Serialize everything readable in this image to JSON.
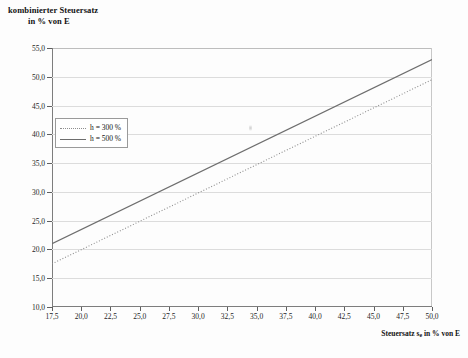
{
  "chart_data": {
    "type": "line",
    "title": "kombinierter Steuersatz in % von E",
    "title_line1": "kombinierter Steuersatz",
    "title_line2": "in % von E",
    "xlabel": "Steuersatz se in % von E",
    "xlabel_main": "Steuersatz s",
    "xlabel_sub": "e",
    "xlabel_tail": " in % von E",
    "ylabel": "kombinierter Steuersatz in % von E",
    "xlim": [
      17.5,
      50.0
    ],
    "ylim": [
      10.0,
      55.0
    ],
    "xticks": [
      17.5,
      20.0,
      22.5,
      25.0,
      27.5,
      30.0,
      32.5,
      35.0,
      37.5,
      40.0,
      42.5,
      45.0,
      47.5,
      50.0
    ],
    "xtick_labels": [
      "17,5",
      "20,0",
      "22,5",
      "25,0",
      "27,5",
      "30,0",
      "32,5",
      "35,0",
      "37,5",
      "40,0",
      "42,5",
      "45,0",
      "47,5",
      "50,0"
    ],
    "yticks": [
      10.0,
      15.0,
      20.0,
      25.0,
      30.0,
      35.0,
      40.0,
      45.0,
      50.0,
      55.0
    ],
    "ytick_labels": [
      "10,0",
      "15,0",
      "20,0",
      "25,0",
      "30,0",
      "35,0",
      "40,0",
      "45,0",
      "50,0",
      "55,0"
    ],
    "grid": "horizontal",
    "legend_position": "upper-left-inside",
    "series": [
      {
        "name": "h = 300 %",
        "style": "dotted",
        "color": "#8e8e8e",
        "x": [
          17.5,
          50.0
        ],
        "values": [
          17.5,
          49.5
        ]
      },
      {
        "name": "h = 500 %",
        "style": "solid",
        "color": "#6e6e6e",
        "x": [
          17.5,
          50.0
        ],
        "values": [
          21.0,
          53.0
        ]
      }
    ]
  },
  "legend": {
    "items": [
      {
        "label": "h = 300 %"
      },
      {
        "label": "h = 500 %"
      }
    ]
  }
}
